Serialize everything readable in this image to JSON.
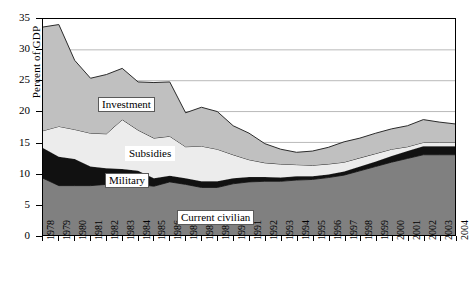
{
  "chart_data": {
    "type": "area",
    "stacked": true,
    "title": "",
    "xlabel": "",
    "ylabel": "Percent of GDP",
    "ylim": [
      0,
      35
    ],
    "yticks": [
      0,
      5,
      10,
      15,
      20,
      25,
      30,
      35
    ],
    "grid": true,
    "grid_axis": "y",
    "legend_position": "inline-labels",
    "categories": [
      "1978",
      "1979",
      "1980",
      "1981",
      "1982",
      "1983",
      "1984",
      "1985",
      "1986",
      "1987",
      "1988",
      "1989",
      "1990",
      "1991",
      "1992",
      "1993",
      "1994",
      "1995",
      "1996",
      "1997",
      "1998",
      "1999",
      "2000",
      "2001",
      "2002",
      "2003",
      "2004"
    ],
    "series": [
      {
        "name": "Current civilian",
        "color": "#808080",
        "values": [
          9.2,
          8.0,
          8.0,
          8.0,
          8.2,
          8.2,
          8.2,
          7.9,
          8.6,
          8.2,
          7.7,
          7.7,
          8.3,
          8.6,
          8.7,
          8.7,
          8.9,
          9.0,
          9.3,
          9.7,
          10.4,
          11.1,
          11.8,
          12.4,
          13.0,
          13.0,
          13.0
        ]
      },
      {
        "name": "Military",
        "color": "#111111",
        "values": [
          4.9,
          4.7,
          4.3,
          3.1,
          2.6,
          2.5,
          2.2,
          1.3,
          1.0,
          1.0,
          1.0,
          1.0,
          0.9,
          0.8,
          0.7,
          0.6,
          0.6,
          0.5,
          0.5,
          0.6,
          0.7,
          0.8,
          1.0,
          1.2,
          1.4,
          1.4,
          1.4
        ]
      },
      {
        "name": "Subsidies",
        "color": "#ececec",
        "values": [
          2.8,
          4.9,
          4.8,
          5.4,
          5.6,
          8.0,
          6.6,
          6.5,
          6.4,
          5.1,
          5.7,
          5.2,
          3.8,
          2.8,
          2.3,
          2.2,
          1.9,
          1.8,
          1.7,
          1.5,
          1.4,
          1.3,
          1.1,
          0.7,
          0.6,
          0.6,
          0.6
        ]
      },
      {
        "name": "Investment",
        "color": "#c0c0c0",
        "values": [
          16.8,
          16.5,
          11.2,
          8.9,
          9.6,
          8.3,
          7.8,
          9.0,
          8.8,
          5.5,
          6.3,
          6.1,
          4.7,
          4.3,
          3.1,
          2.4,
          2.0,
          2.3,
          2.7,
          3.3,
          3.2,
          3.3,
          3.3,
          3.4,
          3.7,
          3.3,
          3.0
        ]
      }
    ],
    "cumulative_boundaries": {
      "current_civilian_top": [
        9.2,
        8.0,
        8.0,
        8.0,
        8.2,
        8.2,
        8.2,
        7.9,
        8.6,
        8.2,
        7.7,
        7.7,
        8.3,
        8.6,
        8.7,
        8.7,
        8.9,
        9.0,
        9.3,
        9.7,
        10.4,
        11.1,
        11.8,
        12.4,
        13.0,
        13.0,
        13.0
      ],
      "military_top": [
        14.1,
        12.7,
        12.3,
        11.1,
        10.8,
        10.7,
        10.4,
        9.2,
        9.6,
        9.2,
        8.7,
        8.7,
        9.2,
        9.4,
        9.4,
        9.3,
        9.5,
        9.5,
        9.8,
        10.3,
        11.1,
        11.9,
        12.8,
        13.6,
        14.4,
        14.4,
        14.4
      ],
      "subsidies_top": [
        16.9,
        17.6,
        17.1,
        16.5,
        16.4,
        18.7,
        17.0,
        15.7,
        16.0,
        14.3,
        14.4,
        13.9,
        13.0,
        12.2,
        11.7,
        11.5,
        11.4,
        11.3,
        11.5,
        11.8,
        12.5,
        13.2,
        13.9,
        14.3,
        15.0,
        15.0,
        15.0
      ],
      "investment_top": [
        33.7,
        34.1,
        28.3,
        25.4,
        26.0,
        27.0,
        24.8,
        24.7,
        24.8,
        19.8,
        20.7,
        20.0,
        17.7,
        16.5,
        14.8,
        13.9,
        13.4,
        13.6,
        14.2,
        15.1,
        15.7,
        16.5,
        17.2,
        17.7,
        18.7,
        18.3,
        18.0
      ]
    }
  },
  "axes": {
    "y_title": "Percent of GDP",
    "y_tick_labels": [
      "0",
      "5",
      "10",
      "15",
      "20",
      "25",
      "30",
      "35"
    ],
    "x_tick_labels": [
      "1978",
      "1979",
      "1980",
      "1981",
      "1982",
      "1983",
      "1984",
      "1985",
      "1986",
      "1987",
      "1988",
      "1989",
      "1990",
      "1991",
      "1992",
      "1993",
      "1994",
      "1995",
      "1996",
      "1997",
      "1998",
      "1999",
      "2000",
      "2001",
      "2002",
      "2003",
      "2004"
    ]
  },
  "series_labels": [
    {
      "text": "Investment"
    },
    {
      "text": "Subsidies"
    },
    {
      "text": "Military"
    },
    {
      "text": "Current civilian"
    }
  ]
}
